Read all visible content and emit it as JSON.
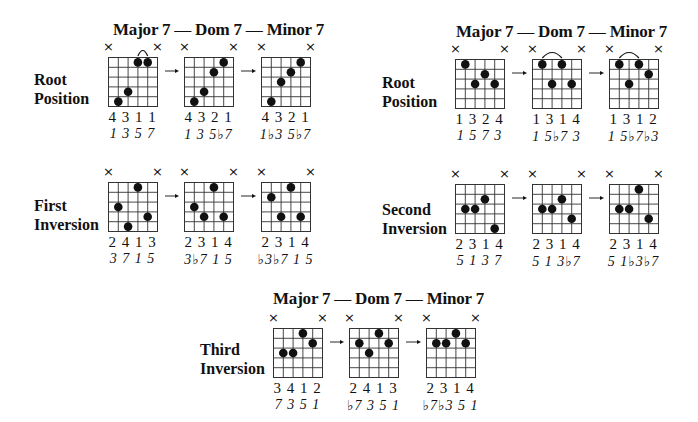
{
  "sections": [
    {
      "id": "left-top",
      "header": {
        "major": "Major 7",
        "dom": "Dom 7",
        "minor": "Minor 7"
      },
      "header_pos": [
        113,
        20
      ],
      "rows": [
        {
          "label_line1": "Root",
          "label_line2": "Position",
          "label_pos": [
            34,
            70
          ],
          "chords": [
            {
              "name": "major-7",
              "x": 108,
              "y": 57,
              "dots": [
                [
                  2,
                  5
                ],
                [
                  3,
                  4
                ],
                [
                  4,
                  1
                ],
                [
                  5,
                  1
                ]
              ],
              "barre": [
                4,
                5
              ],
              "fingering": "4 3 1 1",
              "intervals": "1 3 5 7"
            },
            {
              "name": "dom-7",
              "x": 184,
              "y": 57,
              "dots": [
                [
                  2,
                  5
                ],
                [
                  3,
                  4
                ],
                [
                  4,
                  2
                ],
                [
                  5,
                  1
                ]
              ],
              "barre": null,
              "fingering": "4 3 2 1",
              "intervals": "1 3 5♭7"
            },
            {
              "name": "minor-7",
              "x": 261,
              "y": 57,
              "dots": [
                [
                  2,
                  5
                ],
                [
                  3,
                  3
                ],
                [
                  4,
                  2
                ],
                [
                  5,
                  1
                ]
              ],
              "barre": null,
              "fingering": "4 3 2 1",
              "intervals": "1♭3 5♭7"
            }
          ]
        },
        {
          "label_line1": "First",
          "label_line2": "Inversion",
          "label_pos": [
            34,
            196
          ],
          "chords": [
            {
              "name": "major-7",
              "x": 108,
              "y": 182,
              "dots": [
                [
                  2,
                  3
                ],
                [
                  3,
                  5
                ],
                [
                  4,
                  1
                ],
                [
                  5,
                  4
                ]
              ],
              "barre": null,
              "fingering": "2 4 1 3",
              "intervals": "3 7 1 5"
            },
            {
              "name": "dom-7",
              "x": 184,
              "y": 182,
              "dots": [
                [
                  2,
                  3
                ],
                [
                  3,
                  4
                ],
                [
                  4,
                  1
                ],
                [
                  5,
                  4
                ]
              ],
              "barre": null,
              "fingering": "2 3 1 4",
              "intervals": "3♭7 1 5"
            },
            {
              "name": "minor-7",
              "x": 261,
              "y": 182,
              "dots": [
                [
                  2,
                  2
                ],
                [
                  3,
                  4
                ],
                [
                  4,
                  1
                ],
                [
                  5,
                  4
                ]
              ],
              "barre": null,
              "fingering": "2 3 1 4",
              "intervals": "♭3♭7 1 5"
            }
          ]
        }
      ]
    },
    {
      "id": "right-top",
      "header": {
        "major": "Major 7",
        "dom": "Dom 7",
        "minor": "Minor 7"
      },
      "header_pos": [
        456,
        22
      ],
      "rows": [
        {
          "label_line1": "Root",
          "label_line2": "Position",
          "label_pos": [
            382,
            73
          ],
          "chords": [
            {
              "name": "major-7",
              "x": 455,
              "y": 59,
              "dots": [
                [
                  2,
                  1
                ],
                [
                  3,
                  3
                ],
                [
                  4,
                  2
                ],
                [
                  5,
                  3
                ]
              ],
              "barre": null,
              "fingering": "1 3 2 4",
              "intervals": "1 5 7 3"
            },
            {
              "name": "dom-7",
              "x": 532,
              "y": 59,
              "dots": [
                [
                  2,
                  1
                ],
                [
                  3,
                  3
                ],
                [
                  4,
                  1
                ],
                [
                  5,
                  3
                ]
              ],
              "barre": [
                2,
                4
              ],
              "fingering": "1 3 1 4",
              "intervals": "1 5♭7 3"
            },
            {
              "name": "minor-7",
              "x": 609,
              "y": 59,
              "dots": [
                [
                  2,
                  1
                ],
                [
                  3,
                  3
                ],
                [
                  4,
                  1
                ],
                [
                  5,
                  2
                ]
              ],
              "barre": [
                2,
                4
              ],
              "fingering": "1 3 1 2",
              "intervals": "1 5♭7♭3"
            }
          ]
        },
        {
          "label_line1": "Second",
          "label_line2": "Inversion",
          "label_pos": [
            382,
            200
          ],
          "chords": [
            {
              "name": "major-7",
              "x": 455,
              "y": 184,
              "dots": [
                [
                  2,
                  3
                ],
                [
                  3,
                  3
                ],
                [
                  4,
                  2
                ],
                [
                  5,
                  5
                ]
              ],
              "barre": null,
              "fingering": "2 3 1 4",
              "intervals": "5 1 3 7"
            },
            {
              "name": "dom-7",
              "x": 532,
              "y": 184,
              "dots": [
                [
                  2,
                  3
                ],
                [
                  3,
                  3
                ],
                [
                  4,
                  2
                ],
                [
                  5,
                  4
                ]
              ],
              "barre": null,
              "fingering": "2 3 1 4",
              "intervals": "5 1 3♭7"
            },
            {
              "name": "minor-7",
              "x": 609,
              "y": 184,
              "dots": [
                [
                  2,
                  3
                ],
                [
                  3,
                  3
                ],
                [
                  4,
                  1
                ],
                [
                  5,
                  4
                ]
              ],
              "barre": null,
              "fingering": "2 3 1 4",
              "intervals": "5 1♭3♭7"
            }
          ]
        }
      ]
    },
    {
      "id": "bottom",
      "header": {
        "major": "Major 7",
        "dom": "Dom 7",
        "minor": "Minor 7"
      },
      "header_pos": [
        273,
        289
      ],
      "rows": [
        {
          "label_line1": "Third",
          "label_line2": "Inversion",
          "label_pos": [
            200,
            340
          ],
          "chords": [
            {
              "name": "major-7",
              "x": 273,
              "y": 328,
              "dots": [
                [
                  2,
                  3
                ],
                [
                  3,
                  3
                ],
                [
                  4,
                  1
                ],
                [
                  5,
                  2
                ]
              ],
              "barre": null,
              "fingering": "3 4 1 2",
              "intervals": "7 3 5 1"
            },
            {
              "name": "dom-7",
              "x": 349,
              "y": 328,
              "dots": [
                [
                  2,
                  2
                ],
                [
                  3,
                  3
                ],
                [
                  4,
                  1
                ],
                [
                  5,
                  2
                ]
              ],
              "barre": null,
              "fingering": "2 4 1 3",
              "intervals": "♭7 3 5 1"
            },
            {
              "name": "minor-7",
              "x": 426,
              "y": 328,
              "dots": [
                [
                  2,
                  2
                ],
                [
                  3,
                  2
                ],
                [
                  4,
                  1
                ],
                [
                  5,
                  2
                ]
              ],
              "barre": null,
              "fingering": "2 3 1 4",
              "intervals": "♭7♭3 5 1"
            }
          ]
        }
      ]
    }
  ],
  "muted_marker": "×",
  "colors": {
    "ink": "#111111",
    "grid": "#333333",
    "background": "#ffffff"
  }
}
